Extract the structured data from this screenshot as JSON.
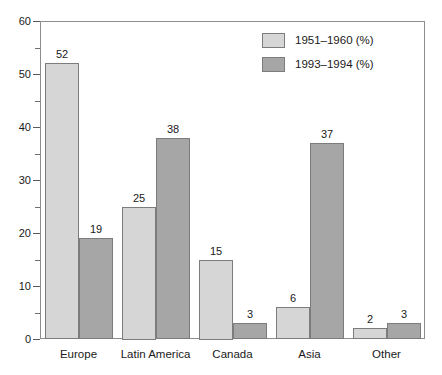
{
  "chart_data": {
    "type": "bar",
    "title": "",
    "subtitle": "",
    "xlabel": "",
    "ylabel": "",
    "ylim": [
      0,
      60
    ],
    "ytick_step": 10,
    "yminor_step": 5,
    "grid": false,
    "legend_position": "top-right-inside",
    "categories": [
      "Europe",
      "Latin America",
      "Canada",
      "Asia",
      "Other"
    ],
    "yticks": [
      "0",
      "10",
      "20",
      "30",
      "40",
      "50",
      "60"
    ],
    "series": [
      {
        "name": "1951–1960 (%)",
        "color": "#d6d6d6",
        "values": [
          52,
          25,
          15,
          6,
          2
        ]
      },
      {
        "name": "1993–1994 (%)",
        "color": "#a6a6a6",
        "values": [
          19,
          38,
          3,
          37,
          3
        ]
      }
    ]
  },
  "legend": {
    "items": [
      {
        "label": "1951–1960 (%)",
        "swatch": "light-gray-swatch"
      },
      {
        "label": "1993–1994 (%)",
        "swatch": "dark-gray-swatch"
      }
    ]
  }
}
